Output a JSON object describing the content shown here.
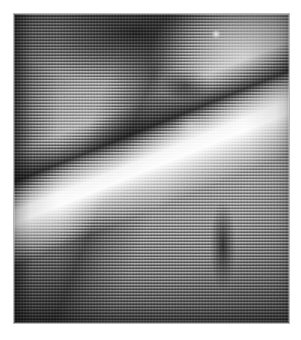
{
  "document": {
    "title": "Halftone-screened monochrome photograph",
    "media_type": "scanned printed photograph",
    "color_mode": "grayscale",
    "canvas": {
      "width_px": 301,
      "height_px": 340,
      "background_color": "#ffffff"
    }
  },
  "plate": {
    "name": "photograph-plate",
    "x_px": 14,
    "y_px": 14,
    "width_px": 275,
    "height_px": 309,
    "border_color": "#b9b9b9",
    "base_color": "#8a8a8a"
  },
  "halftone": {
    "pattern": "horizontal line screen",
    "line_period_px": 3,
    "orientation_deg": 0,
    "secondary_pattern": "vertical dot beat",
    "secondary_period_px": 3,
    "highlight_line_color": "#ffffff",
    "shadow_line_color": "#000000"
  },
  "tonal_range": {
    "darkest": "#1a1a1a",
    "shadow": "#3a3a3a",
    "midtone": "#8e8e8e",
    "highlight": "#d8d8d8",
    "brightest": "#ffffff"
  },
  "features": [
    {
      "name": "dark-upper-mass",
      "description": "Deep shadow band sweeping across the top centre of the plate",
      "tone": "#1a1a1a",
      "center_pct": {
        "x": 44,
        "y": 6
      }
    },
    {
      "name": "bright-upper-right-field",
      "description": "Pale, mottled bright region filling the upper right quadrant",
      "tone": "#e8e8e8",
      "center_pct": {
        "x": 84,
        "y": 14
      }
    },
    {
      "name": "specular-dot",
      "description": "Small isolated white specular highlight near the top right",
      "tone": "#ffffff",
      "center_pct": {
        "x": 73.5,
        "y": 6.5
      }
    },
    {
      "name": "dark-nub-shadow",
      "description": "Compact dark lobe just right of centre, below the upper mass",
      "tone": "#0c0c0c",
      "center_pct": {
        "x": 62.5,
        "y": 23
      }
    },
    {
      "name": "bright-blob-highlight",
      "description": "Irregular white highlight blob at mid right of the frame",
      "tone": "#ffffff",
      "center_pct": {
        "x": 64,
        "y": 36
      }
    },
    {
      "name": "bright-diagonal-streak",
      "description": "Long brilliant streak running from upper centre down to lower right",
      "tone": "#fdfdfd",
      "angle_deg": 158
    },
    {
      "name": "dark-diagonal-shadow",
      "description": "Dark edge running parallel and to the left of the bright streak",
      "tone": "#141414",
      "angle_deg": 158
    },
    {
      "name": "dark-ridge-left-of-centre",
      "description": "Dark diagonal ridge sweeping from the left margin toward the centre",
      "tone": "#191919",
      "angle_deg": 112
    },
    {
      "name": "left-margin-dark-band",
      "description": "Vertical shadow band hugging the left edge of the plate",
      "tone": "#1e1e1e"
    },
    {
      "name": "pale-mid-left-sweep",
      "description": "Soft light-toned area across the middle left of the plate",
      "tone": "#e1e1e1",
      "center_pct": {
        "x": 26,
        "y": 46
      }
    },
    {
      "name": "lower-right-dark-strut",
      "description": "Narrow dark vertical structure in the lower right quadrant",
      "tone": "#121212",
      "center_pct": {
        "x": 76,
        "y": 75
      }
    },
    {
      "name": "bottom-darkening",
      "description": "Broad tonal falloff darkening the bottom of the plate",
      "tone": "#282828"
    }
  ]
}
